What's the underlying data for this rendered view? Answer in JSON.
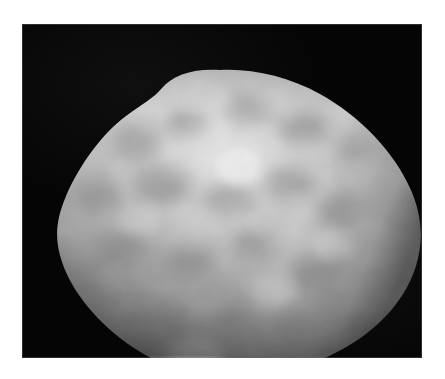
{
  "figure": {
    "kind": "grayscale-astronomical-image",
    "subject_label": "irregular rounded body",
    "background_color": "#050505",
    "page_color": "#ffffff",
    "plate": {
      "left_px": 22,
      "top_px": 24,
      "width_px": 400,
      "height_px": 334
    },
    "caption": "",
    "title": "",
    "annotations": []
  },
  "object": {
    "name": "mottled-spheroid",
    "silhouette_note": "rounded triangular / egg-shaped outline with a raised shoulder at upper left of apex",
    "apex_px": [
      198,
      46
    ],
    "leftmost_px": [
      36,
      205
    ],
    "rightmost_px": [
      400,
      232
    ],
    "bottom_px": [
      232,
      353
    ],
    "brightest_spot_px": [
      215,
      142
    ],
    "surface": "mottled with irregular darker patches and brighter highlands",
    "limb_terminator_note": "sharp dark limb along the lower-left edge",
    "tones": {
      "highlight": "#f2f2f2",
      "midtone": "#b4b4b4",
      "shadow_patch": "#7c7c7c",
      "limb_dark": "#2a2a2a",
      "space_black": "#050505"
    }
  },
  "surface_features": {
    "dark_patches": [
      {
        "cx": 112,
        "cy": 118,
        "rx": 26,
        "ry": 17,
        "tone": "#8d8d8d"
      },
      {
        "cx": 163,
        "cy": 98,
        "rx": 22,
        "ry": 14,
        "tone": "#949494"
      },
      {
        "cx": 226,
        "cy": 86,
        "rx": 24,
        "ry": 15,
        "tone": "#9a9a9a"
      },
      {
        "cx": 283,
        "cy": 104,
        "rx": 27,
        "ry": 16,
        "tone": "#8f8f8f"
      },
      {
        "cx": 74,
        "cy": 170,
        "rx": 25,
        "ry": 18,
        "tone": "#8a8a8a"
      },
      {
        "cx": 140,
        "cy": 160,
        "rx": 30,
        "ry": 19,
        "tone": "#8c8c8c"
      },
      {
        "cx": 206,
        "cy": 176,
        "rx": 26,
        "ry": 17,
        "tone": "#969696"
      },
      {
        "cx": 268,
        "cy": 160,
        "rx": 24,
        "ry": 16,
        "tone": "#8b8b8b"
      },
      {
        "cx": 318,
        "cy": 186,
        "rx": 26,
        "ry": 18,
        "tone": "#8f8f8f"
      },
      {
        "cx": 96,
        "cy": 226,
        "rx": 28,
        "ry": 18,
        "tone": "#898989"
      },
      {
        "cx": 168,
        "cy": 238,
        "rx": 26,
        "ry": 17,
        "tone": "#8e8e8e"
      },
      {
        "cx": 234,
        "cy": 222,
        "rx": 23,
        "ry": 16,
        "tone": "#8a8a8a"
      },
      {
        "cx": 296,
        "cy": 248,
        "rx": 27,
        "ry": 18,
        "tone": "#888888"
      },
      {
        "cx": 140,
        "cy": 292,
        "rx": 26,
        "ry": 16,
        "tone": "#8c8c8c"
      },
      {
        "cx": 208,
        "cy": 300,
        "rx": 28,
        "ry": 17,
        "tone": "#8a8a8a"
      },
      {
        "cx": 272,
        "cy": 308,
        "rx": 24,
        "ry": 15,
        "tone": "#8e8e8e"
      },
      {
        "cx": 334,
        "cy": 126,
        "rx": 20,
        "ry": 14,
        "tone": "#959595"
      },
      {
        "cx": 60,
        "cy": 262,
        "rx": 20,
        "ry": 14,
        "tone": "#878787"
      }
    ],
    "bright_patches": [
      {
        "cx": 215,
        "cy": 142,
        "rx": 22,
        "ry": 16,
        "tone": "#f6f6f6"
      },
      {
        "cx": 178,
        "cy": 70,
        "rx": 28,
        "ry": 16,
        "tone": "#dcdcdc"
      },
      {
        "cx": 120,
        "cy": 196,
        "rx": 22,
        "ry": 14,
        "tone": "#d6d6d6"
      },
      {
        "cx": 252,
        "cy": 266,
        "rx": 24,
        "ry": 15,
        "tone": "#d2d2d2"
      },
      {
        "cx": 310,
        "cy": 222,
        "rx": 20,
        "ry": 14,
        "tone": "#d0d0d0"
      },
      {
        "cx": 172,
        "cy": 330,
        "rx": 30,
        "ry": 14,
        "tone": "#cacaca"
      }
    ]
  }
}
